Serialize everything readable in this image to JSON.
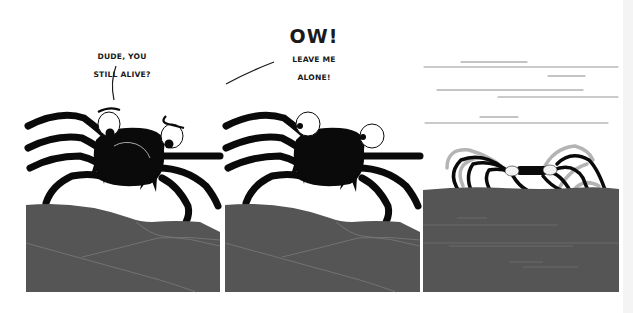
{
  "comic": {
    "panel_count": 3,
    "colors": {
      "background": "#ffffff",
      "rock": "#555555",
      "rock_lines": "#7a7a7a",
      "crab": "#0a0a0a",
      "motion_lines": "#8a8a8a",
      "ghost_legs": "#9a9a9a",
      "text": "#1a1a1a"
    },
    "panels": [
      {
        "id": 1,
        "speech": {
          "line1": "DUDE, YOU",
          "line2": "STILL ALIVE?"
        },
        "scene": "crab-on-rock-worried"
      },
      {
        "id": 2,
        "speech": {
          "exclaim": "OW!",
          "line1": "LEAVE ME",
          "line2": "ALONE!"
        },
        "scene": "crab-on-rock-wide-eyed"
      },
      {
        "id": 3,
        "speech": null,
        "scene": "crab-scurrying-away"
      }
    ]
  }
}
